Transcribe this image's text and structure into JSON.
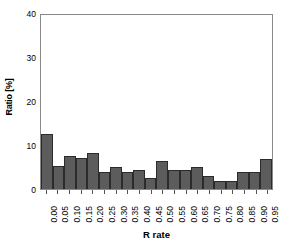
{
  "chart_data": {
    "type": "bar",
    "title": "",
    "xlabel": "R rate",
    "ylabel": "Ratio [%]",
    "categories": [
      "0.00",
      "0.05",
      "0.10",
      "0.15",
      "0.20",
      "0.25",
      "0.30",
      "0.35",
      "0.40",
      "0.45",
      "0.50",
      "0.55",
      "0.60",
      "0.65",
      "0.70",
      "0.75",
      "0.80",
      "0.85",
      "0.90",
      "0.95"
    ],
    "values": [
      12.5,
      5.2,
      7.6,
      7.0,
      8.2,
      3.9,
      5.1,
      3.8,
      4.4,
      2.4,
      6.3,
      4.3,
      4.4,
      4.9,
      3.0,
      1.8,
      1.8,
      3.8,
      3.8,
      6.8
    ],
    "ylim": [
      0,
      40
    ],
    "yticks": [
      "0",
      "10",
      "20",
      "30",
      "40"
    ],
    "ytick_values": [
      0,
      10,
      20,
      30,
      40
    ],
    "grid": false,
    "legend": false,
    "bar_color": "#5c5c5c",
    "bar_edge_color": "#2b2b2b",
    "axis_color": "#8a8a8a",
    "background": "#ffffff"
  },
  "caption": ""
}
